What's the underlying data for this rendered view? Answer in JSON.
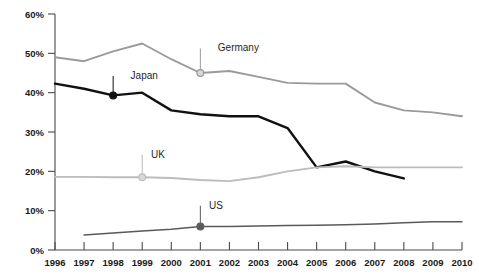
{
  "chart_data": {
    "type": "line",
    "title": "",
    "xlabel": "",
    "ylabel": "",
    "x": [
      1996,
      1997,
      1998,
      1999,
      2000,
      2001,
      2002,
      2003,
      2004,
      2005,
      2006,
      2007,
      2008,
      2009,
      2010
    ],
    "xlim": [
      1996,
      2010
    ],
    "ylim": [
      0,
      60
    ],
    "yticks": [
      0,
      10,
      20,
      30,
      40,
      50,
      60
    ],
    "ytick_labels": [
      "0%",
      "10%",
      "20%",
      "30%",
      "40%",
      "50%",
      "60%"
    ],
    "xtick_labels": [
      "1996",
      "1997",
      "1998",
      "1999",
      "2000",
      "2001",
      "2002",
      "2003",
      "2004",
      "2005",
      "2006",
      "2007",
      "2008",
      "2009",
      "2010"
    ],
    "grid": false,
    "legend": "inline-labels",
    "series": [
      {
        "name": "Germany",
        "color": "#9a9a9a",
        "label": "Germany",
        "label_x": 2001.6,
        "label_y": 51.5,
        "marker_x": 2001,
        "marker_y": 45,
        "x": [
          1996,
          1997,
          1998,
          1999,
          2000,
          2001,
          2002,
          2003,
          2004,
          2005,
          2006,
          2007,
          2008,
          2009,
          2010
        ],
        "values": [
          49.0,
          48.0,
          50.5,
          52.5,
          48.5,
          45.0,
          45.5,
          44.0,
          42.5,
          42.3,
          42.3,
          37.5,
          35.5,
          35.0,
          34.0
        ]
      },
      {
        "name": "Japan",
        "color": "#111111",
        "label": "Japan",
        "label_x": 1998.6,
        "label_y": 44.5,
        "marker_x": 1998,
        "marker_y": 39.3,
        "x": [
          1996,
          1997,
          1998,
          1999,
          2000,
          2001,
          2002,
          2003,
          2004,
          2005,
          2006,
          2007,
          2008
        ],
        "values": [
          42.3,
          41.0,
          39.3,
          40.0,
          35.5,
          34.5,
          34.0,
          34.0,
          31.0,
          21.0,
          22.5,
          20.0,
          18.2
        ]
      },
      {
        "name": "UK",
        "color": "#bcbcbc",
        "label": "UK",
        "label_x": 1999.3,
        "label_y": 24.5,
        "marker_x": 1999,
        "marker_y": 18.5,
        "x": [
          1996,
          1997,
          1998,
          1999,
          2000,
          2001,
          2002,
          2003,
          2004,
          2005,
          2006,
          2007,
          2008,
          2009,
          2010
        ],
        "values": [
          18.6,
          18.6,
          18.5,
          18.5,
          18.3,
          17.8,
          17.5,
          18.5,
          20.0,
          21.0,
          21.3,
          21.0,
          21.0,
          21.0,
          21.0
        ]
      },
      {
        "name": "US",
        "color": "#5a5a5a",
        "label": "US",
        "label_x": 2001.3,
        "label_y": 11.5,
        "marker_x": 2001,
        "marker_y": 6.0,
        "x": [
          1997,
          1998,
          1999,
          2000,
          2001,
          2002,
          2003,
          2004,
          2005,
          2006,
          2007,
          2008,
          2009,
          2010
        ],
        "values": [
          3.8,
          4.3,
          4.8,
          5.3,
          6.0,
          6.0,
          6.1,
          6.2,
          6.3,
          6.4,
          6.6,
          6.9,
          7.2,
          7.2
        ]
      }
    ]
  }
}
